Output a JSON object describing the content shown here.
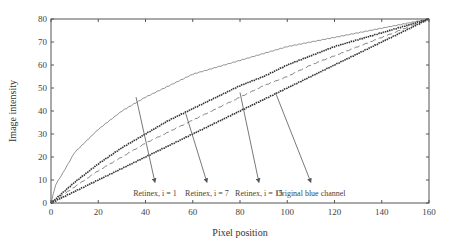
{
  "chart_data": {
    "type": "line",
    "title": "",
    "xlabel": "Pixel position",
    "ylabel": "Image intensity",
    "xlim": [
      0,
      160
    ],
    "ylim": [
      0,
      80
    ],
    "xticks": [
      0,
      20,
      40,
      60,
      80,
      100,
      120,
      140,
      160
    ],
    "yticks": [
      0,
      10,
      20,
      30,
      40,
      50,
      60,
      70,
      80
    ],
    "grid": false,
    "legend": "annotations with arrows",
    "series": [
      {
        "name": "Retinex, i = 1",
        "style": "thin-solid",
        "x": [
          0,
          2,
          5,
          10,
          15,
          20,
          30,
          40,
          50,
          60,
          70,
          80,
          90,
          100,
          110,
          120,
          130,
          140,
          150,
          160
        ],
        "values": [
          0,
          8,
          13,
          22,
          27,
          32,
          40,
          46,
          51,
          56,
          59,
          62,
          65,
          68,
          70,
          72,
          74,
          76,
          78,
          80
        ]
      },
      {
        "name": "Retinex, i = 7",
        "style": "thick-dotted-marker",
        "x": [
          0,
          10,
          20,
          30,
          40,
          50,
          60,
          70,
          80,
          90,
          100,
          110,
          120,
          130,
          140,
          150,
          160
        ],
        "values": [
          0,
          9,
          17,
          24,
          30,
          36,
          41,
          46,
          51,
          55,
          60,
          64,
          68,
          71,
          74,
          77,
          80
        ]
      },
      {
        "name": "Retinex, i = 15",
        "style": "dashed",
        "x": [
          0,
          10,
          20,
          30,
          40,
          50,
          60,
          70,
          80,
          90,
          100,
          110,
          120,
          130,
          140,
          150,
          160
        ],
        "values": [
          0,
          7,
          14,
          20,
          26,
          31,
          36,
          41,
          46,
          51,
          55,
          60,
          64,
          68,
          72,
          76,
          80
        ]
      },
      {
        "name": "Original blue channel",
        "style": "thick-dotted-marker",
        "x": [
          0,
          10,
          20,
          30,
          40,
          50,
          60,
          70,
          80,
          90,
          100,
          110,
          120,
          130,
          140,
          150,
          160
        ],
        "values": [
          0,
          5,
          10,
          15,
          20,
          25,
          30,
          35,
          40,
          45,
          50,
          55,
          60,
          65,
          70,
          75,
          80
        ]
      }
    ],
    "annotations": [
      {
        "text": "Retinex, i = 1",
        "arrow_from": [
          36,
          46
        ],
        "arrow_to": [
          44,
          9
        ]
      },
      {
        "text": "Retinex, i = 7",
        "arrow_from": [
          57,
          39
        ],
        "arrow_to": [
          66,
          9
        ]
      },
      {
        "text": "Retinex, i = 15",
        "arrow_from": [
          80,
          48
        ],
        "arrow_to": [
          88,
          9
        ]
      },
      {
        "text": "Original blue channel",
        "arrow_from": [
          95,
          48
        ],
        "arrow_to": [
          110,
          9
        ]
      }
    ]
  }
}
